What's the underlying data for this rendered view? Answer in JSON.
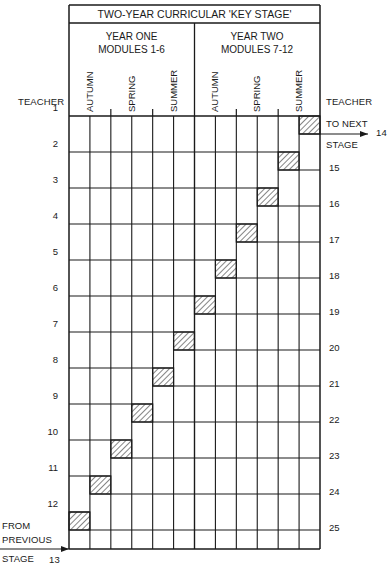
{
  "title": "TWO-YEAR CURRICULAR 'KEY STAGE'",
  "years": [
    {
      "line1": "YEAR ONE",
      "line2": "MODULES 1-6"
    },
    {
      "line1": "YEAR TWO",
      "line2": "MODULES 7-12"
    }
  ],
  "terms": [
    "AUTUMN",
    "SPRING",
    "SUMMER",
    "AUTUMN",
    "SPRING",
    "SUMMER"
  ],
  "left_axis_label": "TEACHER",
  "right_axis_label": "TEACHER",
  "left_teachers": [
    "1",
    "2",
    "3",
    "4",
    "5",
    "6",
    "7",
    "8",
    "9",
    "10",
    "11",
    "12"
  ],
  "right_teachers": [
    "15",
    "16",
    "17",
    "18",
    "19",
    "20",
    "21",
    "22",
    "23",
    "24",
    "25"
  ],
  "to_next": {
    "line1": "TO NEXT",
    "line2": "STAGE",
    "number": "14"
  },
  "from_previous": {
    "line1": "FROM",
    "line2": "PREVIOUS",
    "line3": "STAGE",
    "number": "13"
  },
  "grid": {
    "columns": 12,
    "modules_per_term": 2,
    "hatched_cells": [
      {
        "teacher": "1",
        "module": 12
      },
      {
        "teacher": "2",
        "module": 11
      },
      {
        "teacher": "3",
        "module": 10
      },
      {
        "teacher": "4",
        "module": 9
      },
      {
        "teacher": "5",
        "module": 8
      },
      {
        "teacher": "6",
        "module": 7
      },
      {
        "teacher": "7",
        "module": 6
      },
      {
        "teacher": "8",
        "module": 5
      },
      {
        "teacher": "9",
        "module": 4
      },
      {
        "teacher": "10",
        "module": 3
      },
      {
        "teacher": "11",
        "module": 2
      },
      {
        "teacher": "12",
        "module": 1
      }
    ]
  },
  "colors": {
    "line": "#1a1a1a",
    "hatch": "#333333",
    "background": "#ffffff"
  }
}
